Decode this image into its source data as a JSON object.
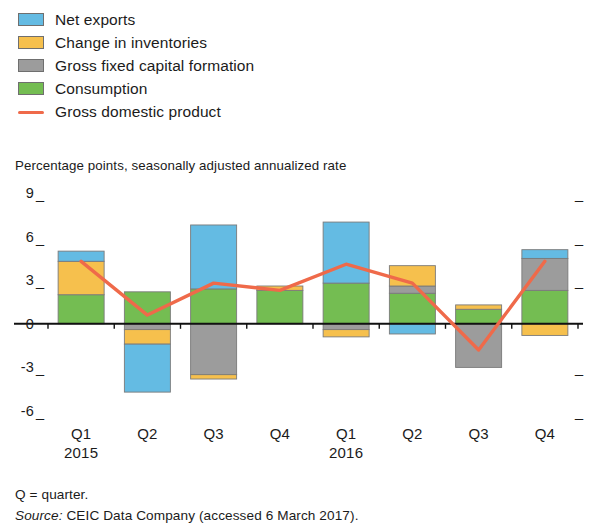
{
  "legend": {
    "items": [
      {
        "label": "Net exports",
        "type": "swatch",
        "color": "#64bbe3"
      },
      {
        "label": "Change in inventories",
        "type": "swatch",
        "color": "#f6c04d"
      },
      {
        "label": "Gross fixed capital formation",
        "type": "swatch",
        "color": "#9c9c9c"
      },
      {
        "label": "Consumption",
        "type": "swatch",
        "color": "#74bd52"
      },
      {
        "label": "Gross domestic product",
        "type": "line",
        "color": "#ef6a4a"
      }
    ]
  },
  "axis_subtitle": "Percentage points, seasonally adjusted annualized rate",
  "footnotes": {
    "quarter_note": "Q = quarter.",
    "source_label": "Source:",
    "source_text": "CEIC Data Company (accessed 6 March 2017)."
  },
  "chart_data": {
    "type": "bar",
    "title": "",
    "subtitle": "Percentage points, seasonally adjusted annualized rate",
    "xlabel": "",
    "ylabel": "Percentage points, seasonally adjusted annualized rate",
    "ylim": [
      -6,
      9
    ],
    "yticks": [
      9,
      6,
      3,
      0,
      -3,
      -6
    ],
    "ytick_labels": [
      "9",
      "6",
      "3",
      "0",
      "-3",
      "-6"
    ],
    "grid": false,
    "legend_position": "top-left",
    "stacked": true,
    "categories": [
      "Q1",
      "Q2",
      "Q3",
      "Q4",
      "Q1",
      "Q2",
      "Q3",
      "Q4"
    ],
    "category_years": [
      "2015",
      "",
      "",
      "",
      "2016",
      "",
      "",
      ""
    ],
    "series": [
      {
        "name": "Consumption",
        "color": "#74bd52",
        "values": [
          2.0,
          2.2,
          2.4,
          2.3,
          2.8,
          2.1,
          1.0,
          2.3
        ]
      },
      {
        "name": "Gross fixed capital formation",
        "color": "#9c9c9c",
        "values": [
          0.0,
          -0.4,
          -3.5,
          0.0,
          -0.4,
          0.5,
          -3.0,
          2.2
        ]
      },
      {
        "name": "Change in inventories",
        "color": "#f6c04d",
        "values": [
          2.3,
          -1.0,
          -0.3,
          0.3,
          -0.5,
          1.4,
          0.3,
          -0.8
        ]
      },
      {
        "name": "Net exports",
        "color": "#64bbe3",
        "values": [
          0.7,
          -3.3,
          4.4,
          0.0,
          4.2,
          -0.7,
          0.0,
          0.6
        ]
      }
    ],
    "line_series": {
      "name": "Gross domestic product",
      "color": "#ef6a4a",
      "values": [
        4.3,
        0.6,
        2.8,
        2.3,
        4.1,
        2.8,
        -1.8,
        4.3
      ]
    }
  }
}
